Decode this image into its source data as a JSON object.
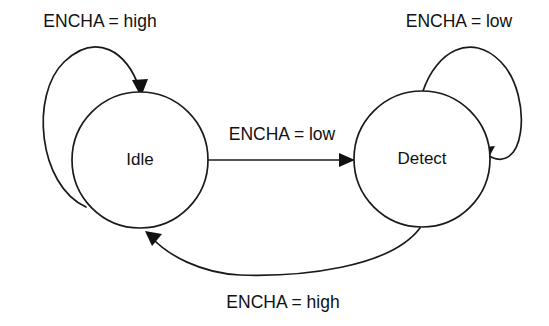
{
  "diagram": {
    "type": "state-transition-diagram",
    "background_color": "#ffffff",
    "stroke_color": "#1a1a1a",
    "text_color": "#111111",
    "states": [
      {
        "id": "idle",
        "label": "Idle",
        "cx": 140,
        "cy": 160,
        "r": 68
      },
      {
        "id": "detect",
        "label": "Detect",
        "cx": 422,
        "cy": 159,
        "r": 68
      }
    ],
    "transitions": [
      {
        "id": "idle-self-loop",
        "from": "idle",
        "to": "idle",
        "label": "ENCHA = high",
        "label_x": 100,
        "label_y": 22,
        "kind": "self-loop-left"
      },
      {
        "id": "idle-to-detect",
        "from": "idle",
        "to": "detect",
        "label": "ENCHA = low",
        "label_x": 282,
        "label_y": 135,
        "kind": "straight"
      },
      {
        "id": "detect-self-loop",
        "from": "detect",
        "to": "detect",
        "label": "ENCHA = low",
        "label_x": 459,
        "label_y": 22,
        "kind": "self-loop-right"
      },
      {
        "id": "detect-to-idle",
        "from": "detect",
        "to": "idle",
        "label": "ENCHA = high",
        "label_x": 283,
        "label_y": 303,
        "kind": "curve-bottom"
      }
    ]
  }
}
